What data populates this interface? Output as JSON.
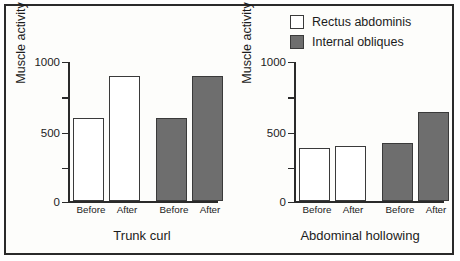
{
  "legend": {
    "items": [
      {
        "label": "Rectus abdominis",
        "swatch": "white",
        "color": "#ffffff"
      },
      {
        "label": "Internal obliques",
        "swatch": "gray",
        "color": "#6e6e6e"
      }
    ]
  },
  "panels": [
    {
      "title": "Trunk curl",
      "ylabel": "Muscle activity",
      "categories": [
        "Before",
        "After",
        "Before",
        "After"
      ]
    },
    {
      "title": "Abdominal hollowing",
      "ylabel": "Muscle activity",
      "categories": [
        "Before",
        "After",
        "Before",
        "After"
      ]
    }
  ],
  "axis": {
    "ticks": [
      {
        "value": 1000,
        "label": "1000"
      },
      {
        "value": 750,
        "label": ""
      },
      {
        "value": 500,
        "label": "500"
      },
      {
        "value": 250,
        "label": ""
      },
      {
        "value": 0,
        "label": "0"
      }
    ]
  },
  "chart_data": [
    {
      "type": "bar",
      "title": "Trunk curl",
      "xlabel": "",
      "ylabel": "Muscle activity",
      "ylim": [
        0,
        1000
      ],
      "categories": [
        "Before",
        "After"
      ],
      "grid": false,
      "legend_position": "top-right",
      "series": [
        {
          "name": "Rectus abdominis",
          "color": "#ffffff",
          "values": [
            600,
            900
          ]
        },
        {
          "name": "Internal obliques",
          "color": "#6e6e6e",
          "values": [
            600,
            900
          ]
        }
      ]
    },
    {
      "type": "bar",
      "title": "Abdominal hollowing",
      "xlabel": "",
      "ylabel": "Muscle activity",
      "ylim": [
        0,
        1000
      ],
      "categories": [
        "Before",
        "After"
      ],
      "grid": false,
      "legend_position": "top-right",
      "series": [
        {
          "name": "Rectus abdominis",
          "color": "#ffffff",
          "values": [
            385,
            400
          ]
        },
        {
          "name": "Internal obliques",
          "color": "#6e6e6e",
          "values": [
            420,
            640
          ]
        }
      ]
    }
  ]
}
